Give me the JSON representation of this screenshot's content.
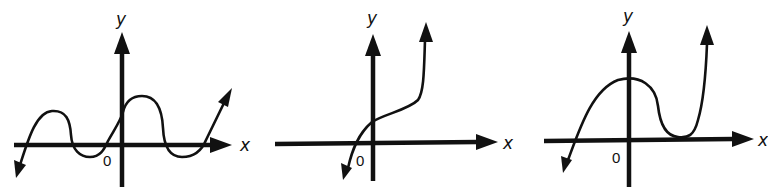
{
  "graphs": [
    {
      "id": "graph-1",
      "x_label": "x",
      "y_label": "y",
      "origin_label": "0",
      "description": "Polynomial curve with three x-intercept crossings and touch points; starts down-left, two humps above axis, two dips below, ends up-right"
    },
    {
      "id": "graph-2",
      "x_label": "x",
      "y_label": "y",
      "origin_label": "0",
      "description": "Increasing curve crossing x-axis left of origin, passing y-axis above origin, rising steeply to upper right"
    },
    {
      "id": "graph-3",
      "x_label": "x",
      "y_label": "y",
      "origin_label": "0",
      "description": "Curve crossing x-axis left of origin, maximum near y-axis, touching x-axis at positive x (double root), then rising steeply"
    }
  ],
  "colors": {
    "ink": "#111111",
    "background": "#ffffff"
  }
}
